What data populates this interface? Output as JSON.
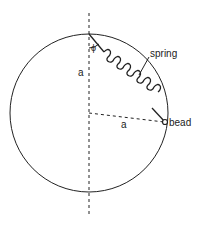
{
  "diagram": {
    "labels": {
      "spring": "spring",
      "bead": "bead",
      "radius_vertical": "a",
      "radius_horizontal": "a",
      "angle": "ϕ"
    },
    "geometry": {
      "circle_center": [
        89,
        113
      ],
      "circle_radius": 79,
      "top_point": [
        89,
        34
      ],
      "bead_point": [
        165,
        122
      ]
    },
    "colors": {
      "stroke": "#222222",
      "background": "#ffffff"
    }
  }
}
